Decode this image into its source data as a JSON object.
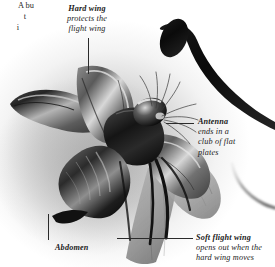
{
  "image": {
    "subject": "beetle-in-flight-photograph",
    "style": "black-and-white-photograph",
    "background_color": "#ffffff",
    "vignette_color": "#9a9a9a",
    "text_color": "#1a1a1a",
    "leader_line_color": "#2b2b2b"
  },
  "labels": {
    "hard_wing": {
      "term": "Hard wing",
      "description": "protects the flight wing",
      "line1": "Hard wing",
      "line2": "protects the",
      "line3": "flight wing"
    },
    "antenna": {
      "term": "Antenna",
      "description": "ends in a club of flat plates",
      "line1": "Antenna",
      "line2": "ends in a",
      "line3": "club of flat",
      "line4": "plates"
    },
    "abdomen": {
      "term": "Abdomen",
      "description": ""
    },
    "soft_flight_wing": {
      "term": "Soft flight wing",
      "description": "opens out when the hard wing moves",
      "line1": "Soft flight wing",
      "line2": "opens out when the",
      "line3": "hard wing moves"
    },
    "cutoff_text": {
      "line1": "A bu",
      "line2": "t",
      "line3": "i"
    }
  }
}
